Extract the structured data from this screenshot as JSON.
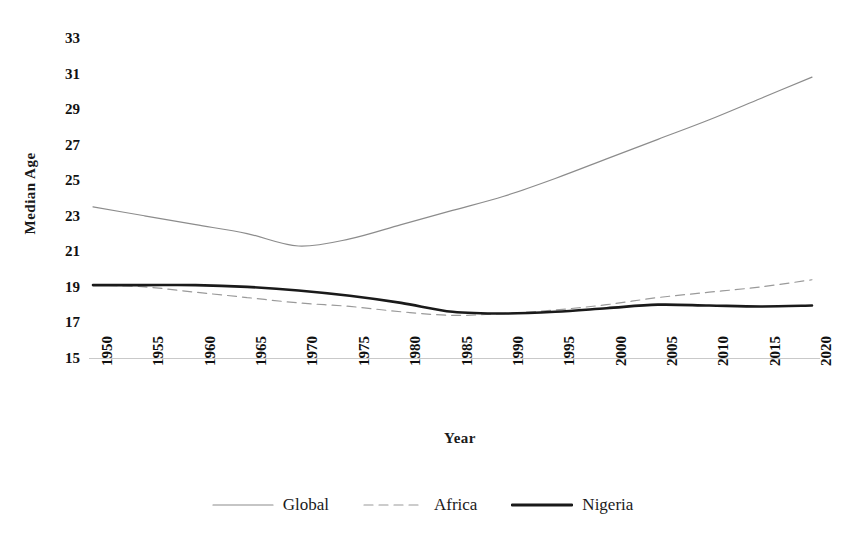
{
  "chart_data": {
    "type": "line",
    "title": "",
    "xlabel": "Year",
    "ylabel": "Median Age",
    "x": [
      1950,
      1955,
      1960,
      1965,
      1970,
      1975,
      1980,
      1985,
      1990,
      1995,
      2000,
      2005,
      2010,
      2015,
      2020
    ],
    "xtick_labels": [
      "1950",
      "1955",
      "1960",
      "1965",
      "1970",
      "1975",
      "1980",
      "1985",
      "1990",
      "1995",
      "2000",
      "2005",
      "2010",
      "2015",
      "2020"
    ],
    "ytick_labels": [
      "33",
      "31",
      "29",
      "27",
      "25",
      "23",
      "21",
      "19",
      "17",
      "15"
    ],
    "yticks": [
      33,
      31,
      29,
      27,
      25,
      23,
      21,
      19,
      17,
      15
    ],
    "ylim": [
      15,
      33
    ],
    "xlim": [
      1950,
      2020
    ],
    "grid": false,
    "legend_position": "bottom",
    "series": [
      {
        "name": "Global",
        "style": "solid-thin",
        "color": "#8c8c8c",
        "values": [
          23.5,
          23.0,
          22.5,
          22.0,
          21.3,
          21.7,
          22.5,
          23.3,
          24.1,
          25.1,
          26.2,
          27.3,
          28.4,
          29.6,
          30.8
        ]
      },
      {
        "name": "Africa",
        "style": "dashed",
        "color": "#9a9a9a",
        "values": [
          19.1,
          19.0,
          18.7,
          18.4,
          18.1,
          17.9,
          17.6,
          17.4,
          17.5,
          17.7,
          18.0,
          18.4,
          18.7,
          19.0,
          19.4
        ]
      },
      {
        "name": "Nigeria",
        "style": "solid-thick",
        "color": "#1a1a1a",
        "values": [
          19.1,
          19.1,
          19.1,
          19.0,
          18.8,
          18.5,
          18.1,
          17.6,
          17.5,
          17.6,
          17.8,
          18.0,
          17.95,
          17.9,
          17.95
        ]
      }
    ]
  },
  "legend": {
    "items": [
      {
        "label": "Global"
      },
      {
        "label": "Africa"
      },
      {
        "label": "Nigeria"
      }
    ]
  }
}
